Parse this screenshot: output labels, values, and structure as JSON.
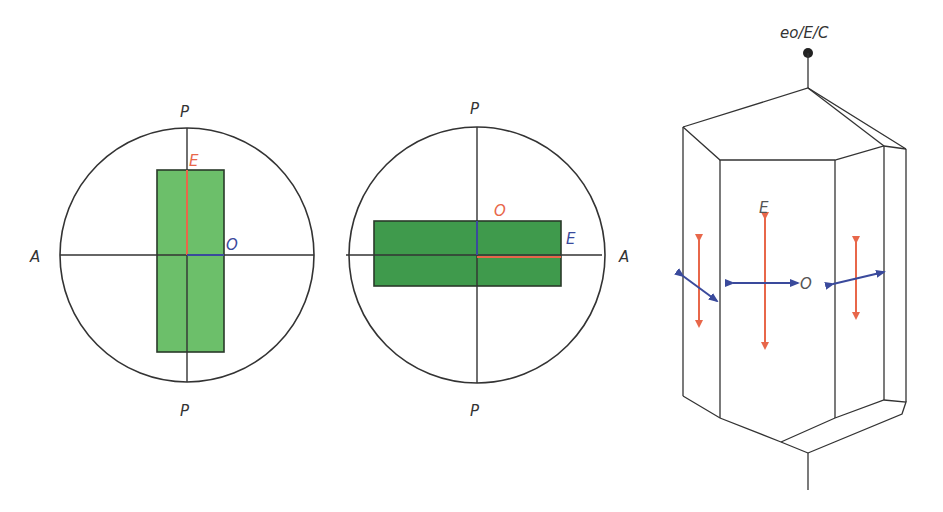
{
  "figure": {
    "left_panel": {
      "labels": {
        "top": "P",
        "bottom": "P",
        "left": "A",
        "extraordinary": "E",
        "ordinary": "O"
      },
      "crystal_color": "#6cbf6a",
      "orientation": "vertical"
    },
    "middle_panel": {
      "labels": {
        "top": "P",
        "bottom": "P",
        "right": "A",
        "ordinary": "O",
        "extraordinary": "E"
      },
      "crystal_color": "#3f9a4c",
      "orientation": "horizontal"
    },
    "right_panel": {
      "axis_label": "eo/E/C",
      "vibration_labels": {
        "extraordinary": "E",
        "ordinary": "O"
      }
    },
    "colors": {
      "extraordinary_ray": "#e8674a",
      "ordinary_ray": "#3a4a9c",
      "line": "#333333",
      "text": "#333333"
    }
  }
}
